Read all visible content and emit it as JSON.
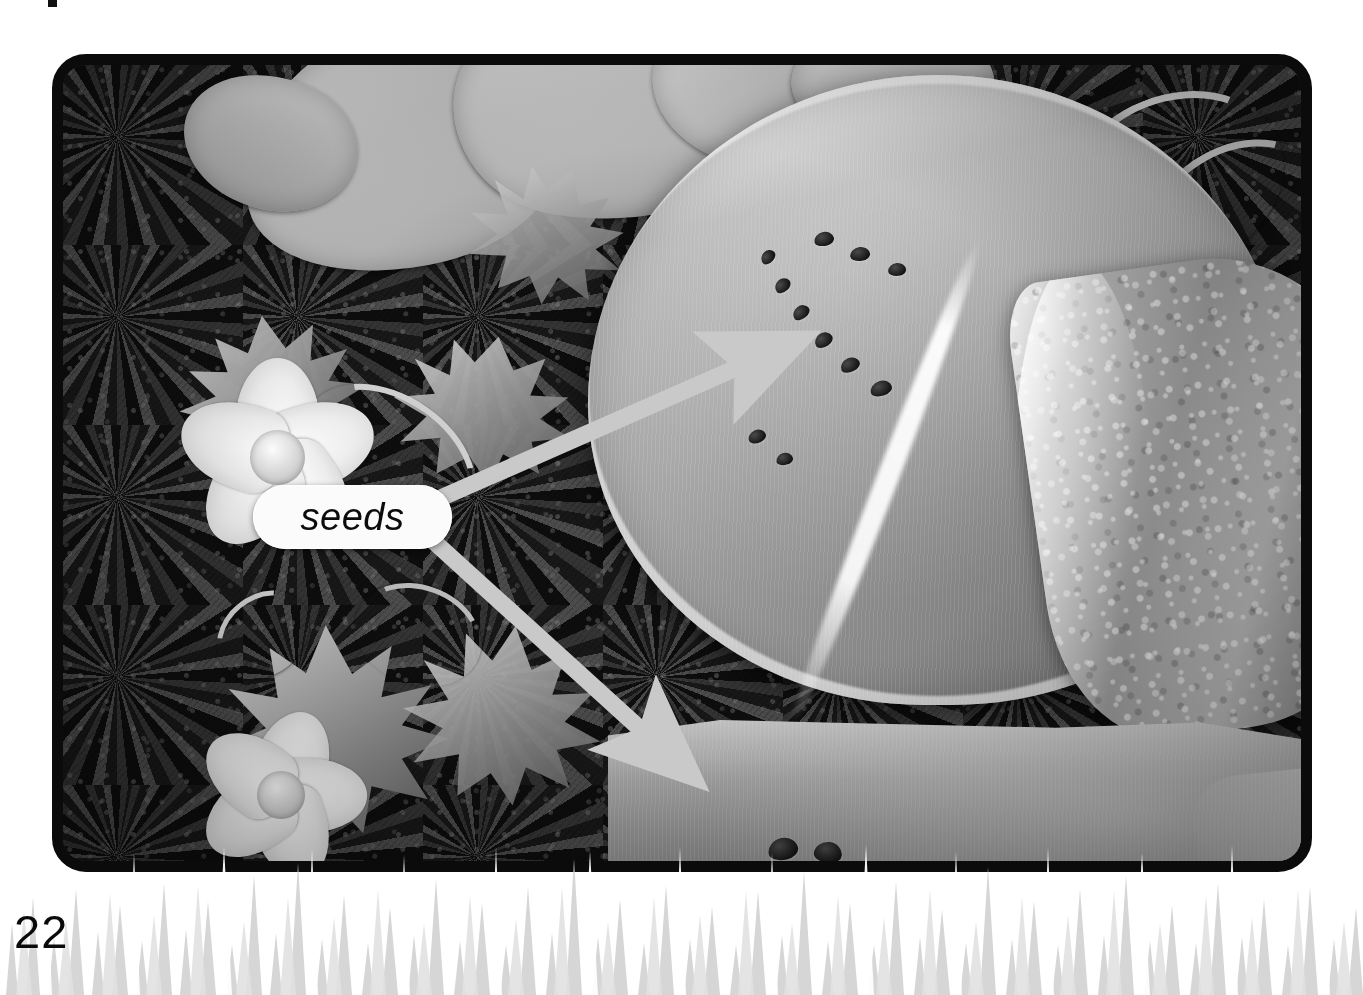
{
  "page": {
    "number": "22",
    "background_color": "#ffffff",
    "width": 1363,
    "height": 995
  },
  "photo": {
    "frame_color": "#0b0b0b",
    "subject": "cut watermelon in a garden",
    "scene_elements": [
      {
        "name": "soil-background",
        "description": "dark garden soil"
      },
      {
        "name": "leaf",
        "description": "pale watermelon leaf"
      },
      {
        "name": "flower",
        "description": "white watermelon blossom"
      },
      {
        "name": "vine-tendril",
        "description": "curling watermelon vine"
      },
      {
        "name": "whole-watermelon",
        "description": "watermelon cut open showing flesh"
      },
      {
        "name": "watermelon-wedge",
        "description": "wedge cut from the melon"
      },
      {
        "name": "watermelon-slice",
        "description": "slice of watermelon in foreground"
      }
    ]
  },
  "callout": {
    "label": "seeds",
    "pill_color": "#fbfbfb",
    "text_color": "#0c0c0c"
  },
  "arrows": {
    "color": "#c9c9c9",
    "items": [
      {
        "name": "arrow-to-whole-melon-seeds",
        "target": "seeds in the cut watermelon",
        "from": [
          442,
          496
        ],
        "to": [
          812,
          336
        ]
      },
      {
        "name": "arrow-to-slice-seeds",
        "target": "seeds in the watermelon slice",
        "from": [
          434,
          541
        ],
        "to": [
          703,
          786
        ]
      }
    ]
  },
  "grass": {
    "name": "grass-band",
    "color": "#c6c6c6"
  }
}
